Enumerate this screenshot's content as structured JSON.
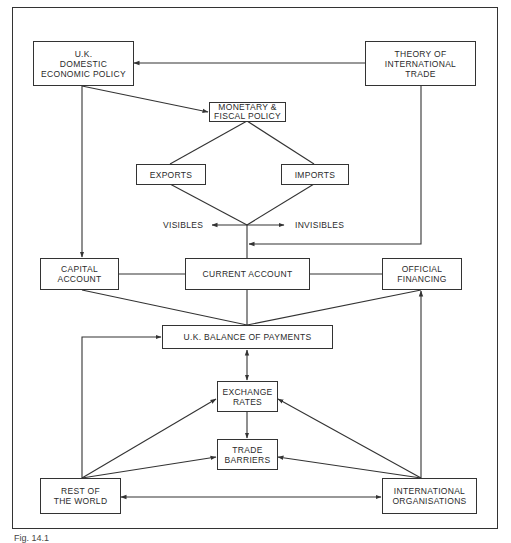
{
  "diagram": {
    "nodes": {
      "uk_domestic": "U.K.\nDOMESTIC\nECONOMIC POLICY",
      "theory_trade": "THEORY OF\nINTERNATIONAL\nTRADE",
      "monetary_fiscal": "MONETARY &\nFISCAL POLICY",
      "exports": "EXPORTS",
      "imports": "IMPORTS",
      "capital_account": "CAPITAL\nACCOUNT",
      "current_account": "CURRENT ACCOUNT",
      "official_financing": "OFFICIAL\nFINANCING",
      "uk_bop": "U.K. BALANCE OF PAYMENTS",
      "exchange_rates": "EXCHANGE\nRATES",
      "trade_barriers": "TRADE\nBARRIERS",
      "rest_of_world": "REST OF\nTHE WORLD",
      "intl_orgs": "INTERNATIONAL\nORGANISATIONS"
    },
    "labels": {
      "visibles": "VISIBLES",
      "invisibles": "INVISIBLES"
    },
    "edges": [
      {
        "from": "theory_trade",
        "to": "uk_domestic",
        "type": "arrow"
      },
      {
        "from": "uk_domestic",
        "to": "monetary_fiscal",
        "type": "arrow"
      },
      {
        "from": "monetary_fiscal",
        "to": "exports",
        "type": "line"
      },
      {
        "from": "monetary_fiscal",
        "to": "imports",
        "type": "line"
      },
      {
        "from": "exports",
        "to": "junction",
        "type": "line"
      },
      {
        "from": "imports",
        "to": "junction",
        "type": "line"
      },
      {
        "from": "junction",
        "to": "visibles",
        "type": "arrow"
      },
      {
        "from": "junction",
        "to": "invisibles",
        "type": "arrow"
      },
      {
        "from": "uk_domestic",
        "to": "capital_account",
        "type": "arrow"
      },
      {
        "from": "theory_trade",
        "to": "current_account_line",
        "type": "arrow"
      },
      {
        "from": "capital_account",
        "to": "current_account",
        "type": "line"
      },
      {
        "from": "current_account",
        "to": "official_financing",
        "type": "line"
      },
      {
        "from": "capital_account",
        "to": "uk_bop",
        "type": "line"
      },
      {
        "from": "current_account",
        "to": "uk_bop",
        "type": "line"
      },
      {
        "from": "official_financing",
        "to": "uk_bop",
        "type": "line"
      },
      {
        "from": "rest_of_world",
        "to": "uk_bop",
        "type": "arrow"
      },
      {
        "from": "intl_orgs",
        "to": "official_financing",
        "type": "arrow"
      },
      {
        "from": "uk_bop",
        "to": "exchange_rates",
        "type": "double-arrow"
      },
      {
        "from": "exchange_rates",
        "to": "trade_barriers",
        "type": "arrow"
      },
      {
        "from": "rest_of_world",
        "to": "exchange_rates",
        "type": "arrow"
      },
      {
        "from": "rest_of_world",
        "to": "trade_barriers",
        "type": "arrow"
      },
      {
        "from": "intl_orgs",
        "to": "exchange_rates",
        "type": "arrow"
      },
      {
        "from": "intl_orgs",
        "to": "trade_barriers",
        "type": "arrow"
      },
      {
        "from": "rest_of_world",
        "to": "intl_orgs",
        "type": "double-arrow"
      }
    ]
  },
  "caption": "Fig. 14.1"
}
